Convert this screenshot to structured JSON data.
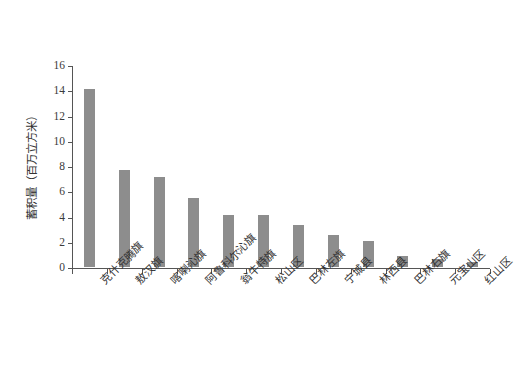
{
  "chart_data": {
    "type": "bar",
    "title": "",
    "xlabel": "",
    "ylabel": "蓄积量（百万立方米）",
    "ylim": [
      0,
      16
    ],
    "ytick_values": [
      0,
      2,
      4,
      6,
      8,
      10,
      12,
      14,
      16
    ],
    "ytick_labels": [
      "0",
      "2",
      "4",
      "6",
      "8",
      "10",
      "12",
      "14",
      "16"
    ],
    "grid": false,
    "legend": false,
    "bar_color": "#8d8d8d",
    "axis_color": "#555555",
    "categories": [
      "克什克腾旗",
      "敖汉旗",
      "喀喇沁旗",
      "阿鲁科尔沁旗",
      "翁牛特旗",
      "松山区",
      "巴林左旗",
      "宁城县",
      "林西县",
      "巴林右旗",
      "元宝山区",
      "红山区"
    ],
    "values": [
      14.1,
      7.7,
      7.1,
      5.5,
      4.15,
      4.1,
      3.35,
      2.55,
      2.05,
      0.85,
      0.6,
      0.4
    ]
  }
}
